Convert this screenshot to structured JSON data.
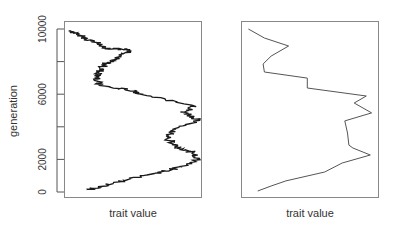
{
  "chart_data": [
    {
      "type": "line",
      "panel": "left",
      "title": "",
      "xlabel": "trait value",
      "ylabel": "generation",
      "ylim": [
        0,
        10000
      ],
      "yticks": [
        0,
        2000,
        6000,
        10000
      ],
      "yticks_minor": [
        4000,
        8000
      ],
      "x_ticks_shown": false,
      "grid": false,
      "description": "Noisy (fine-grained) trajectory of trait value over generations",
      "points": [
        {
          "trait": 4,
          "generation": 9890
        },
        {
          "trait": 12,
          "generation": 9520
        },
        {
          "trait": 22,
          "generation": 9200
        },
        {
          "trait": 29,
          "generation": 8830
        },
        {
          "trait": 42,
          "generation": 8770
        },
        {
          "trait": 49,
          "generation": 8650
        },
        {
          "trait": 36,
          "generation": 8160
        },
        {
          "trait": 29,
          "generation": 7850
        },
        {
          "trait": 25,
          "generation": 7360
        },
        {
          "trait": 23,
          "generation": 6990
        },
        {
          "trait": 25,
          "generation": 6560
        },
        {
          "trait": 51,
          "generation": 6200
        },
        {
          "trait": 55,
          "generation": 6010
        },
        {
          "trait": 97,
          "generation": 5280
        },
        {
          "trait": 88,
          "generation": 4910
        },
        {
          "trait": 99,
          "generation": 4420
        },
        {
          "trait": 80,
          "generation": 3800
        },
        {
          "trait": 77,
          "generation": 3190
        },
        {
          "trait": 83,
          "generation": 2700
        },
        {
          "trait": 96,
          "generation": 2390
        },
        {
          "trait": 99,
          "generation": 1960
        },
        {
          "trait": 77,
          "generation": 1350
        },
        {
          "trait": 55,
          "generation": 920
        },
        {
          "trait": 33,
          "generation": 490
        },
        {
          "trait": 16,
          "generation": 120
        }
      ]
    },
    {
      "type": "line",
      "panel": "right",
      "title": "",
      "xlabel": "trait value",
      "ylabel": "",
      "ylim": [
        0,
        10000
      ],
      "x_ticks_shown": false,
      "y_ticks_shown": false,
      "grid": false,
      "description": "Coarse (sampled) trajectory of trait value over generations",
      "points": [
        {
          "trait": 4,
          "generation": 10000
        },
        {
          "trait": 16,
          "generation": 9450
        },
        {
          "trait": 34,
          "generation": 8960
        },
        {
          "trait": 21,
          "generation": 8340
        },
        {
          "trait": 15,
          "generation": 7850
        },
        {
          "trait": 16,
          "generation": 7360
        },
        {
          "trait": 48,
          "generation": 6990
        },
        {
          "trait": 48,
          "generation": 6380
        },
        {
          "trait": 92,
          "generation": 5890
        },
        {
          "trait": 83,
          "generation": 5460
        },
        {
          "trait": 96,
          "generation": 4850
        },
        {
          "trait": 76,
          "generation": 4360
        },
        {
          "trait": 78,
          "generation": 3620
        },
        {
          "trait": 79,
          "generation": 2880
        },
        {
          "trait": 82,
          "generation": 2700
        },
        {
          "trait": 95,
          "generation": 2270
        },
        {
          "trait": 74,
          "generation": 1780
        },
        {
          "trait": 61,
          "generation": 1230
        },
        {
          "trait": 32,
          "generation": 680
        },
        {
          "trait": 21,
          "generation": 370
        },
        {
          "trait": 11,
          "generation": 60
        }
      ]
    }
  ],
  "axes": {
    "left": {
      "ylabel": "generation",
      "xlabel": "trait value",
      "ytick_labels": [
        "0",
        "2000",
        "6000",
        "10000"
      ]
    },
    "right": {
      "xlabel": "trait value"
    }
  },
  "style": {
    "line_color": "#1a1a1a",
    "right_line_color": "#555555",
    "frame_color": "#888888",
    "text_color": "#333333"
  }
}
